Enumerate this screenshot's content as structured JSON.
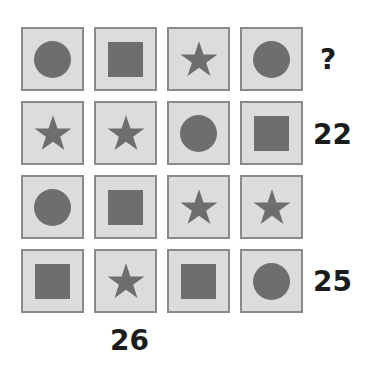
{
  "puzzle": {
    "shape_color": "#6e6e6e",
    "cell_bg": "#dcdcdc",
    "cell_border": "#8a8a8a",
    "grid": [
      [
        "circle",
        "square",
        "star",
        "circle"
      ],
      [
        "star",
        "star",
        "circle",
        "square"
      ],
      [
        "circle",
        "square",
        "star",
        "star"
      ],
      [
        "square",
        "star",
        "square",
        "circle"
      ]
    ],
    "row_clues": [
      "?",
      "22",
      "",
      "25"
    ],
    "column_clues": [
      "",
      "26",
      "",
      ""
    ]
  }
}
